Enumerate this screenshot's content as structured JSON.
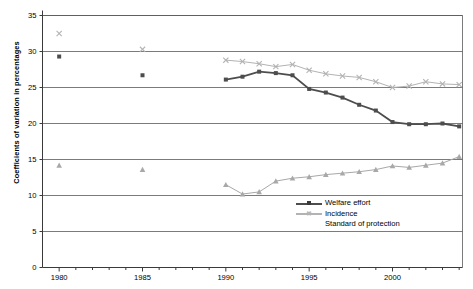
{
  "chart_data": {
    "type": "line",
    "title": "",
    "xlabel": "",
    "ylabel": "Coefficients of variation in percentages",
    "xlim": [
      1979,
      2004.2
    ],
    "ylim": [
      0,
      35
    ],
    "ytick_step": 5,
    "yticks": [
      "0",
      "5",
      "10",
      "15",
      "20",
      "25",
      "30",
      "35"
    ],
    "xticks": [
      "1980",
      "1985",
      "1990",
      "1995",
      "2000"
    ],
    "xtick_values": [
      1980,
      1985,
      1990,
      1995,
      2000
    ],
    "minor_xticks_every": 1,
    "grid": "horizontal",
    "legend_position": "bottom-right",
    "series": [
      {
        "name": "Welfare effort",
        "color": "#4d4d4d",
        "marker": "square",
        "points": [
          {
            "x": 1980,
            "y": 29.3,
            "isolated": true
          },
          {
            "x": 1985,
            "y": 26.7,
            "isolated": true
          },
          {
            "x": 1990,
            "y": 26.1
          },
          {
            "x": 1991,
            "y": 26.5
          },
          {
            "x": 1992,
            "y": 27.2
          },
          {
            "x": 1993,
            "y": 27.0
          },
          {
            "x": 1994,
            "y": 26.7
          },
          {
            "x": 1995,
            "y": 24.8
          },
          {
            "x": 1996,
            "y": 24.3
          },
          {
            "x": 1997,
            "y": 23.6
          },
          {
            "x": 1998,
            "y": 22.6
          },
          {
            "x": 1999,
            "y": 21.8
          },
          {
            "x": 2000,
            "y": 20.2
          },
          {
            "x": 2001,
            "y": 19.9
          },
          {
            "x": 2002,
            "y": 19.9
          },
          {
            "x": 2003,
            "y": 20.0
          },
          {
            "x": 2004,
            "y": 19.6
          }
        ]
      },
      {
        "name": "Incidence",
        "color": "#b3b3b3",
        "marker": "cross",
        "points": [
          {
            "x": 1980,
            "y": 32.5,
            "isolated": true
          },
          {
            "x": 1985,
            "y": 30.3,
            "isolated": true
          },
          {
            "x": 1990,
            "y": 28.8
          },
          {
            "x": 1991,
            "y": 28.6
          },
          {
            "x": 1992,
            "y": 28.3
          },
          {
            "x": 1993,
            "y": 27.9
          },
          {
            "x": 1994,
            "y": 28.2
          },
          {
            "x": 1995,
            "y": 27.4
          },
          {
            "x": 1996,
            "y": 26.9
          },
          {
            "x": 1997,
            "y": 26.6
          },
          {
            "x": 1998,
            "y": 26.4
          },
          {
            "x": 1999,
            "y": 25.8
          },
          {
            "x": 2000,
            "y": 25.0
          },
          {
            "x": 2001,
            "y": 25.2
          },
          {
            "x": 2002,
            "y": 25.8
          },
          {
            "x": 2003,
            "y": 25.5
          },
          {
            "x": 2004,
            "y": 25.4
          }
        ]
      },
      {
        "name": "Standard of protection",
        "color": "#a8a8a8",
        "marker": "triangle",
        "points": [
          {
            "x": 1980,
            "y": 14.2,
            "isolated": true
          },
          {
            "x": 1985,
            "y": 13.6,
            "isolated": true
          },
          {
            "x": 1990,
            "y": 11.5
          },
          {
            "x": 1991,
            "y": 10.2
          },
          {
            "x": 1992,
            "y": 10.5
          },
          {
            "x": 1993,
            "y": 12.0
          },
          {
            "x": 1994,
            "y": 12.4
          },
          {
            "x": 1995,
            "y": 12.6
          },
          {
            "x": 1996,
            "y": 12.9
          },
          {
            "x": 1997,
            "y": 13.1
          },
          {
            "x": 1998,
            "y": 13.3
          },
          {
            "x": 1999,
            "y": 13.6
          },
          {
            "x": 2000,
            "y": 14.1
          },
          {
            "x": 2001,
            "y": 13.9
          },
          {
            "x": 2002,
            "y": 14.2
          },
          {
            "x": 2003,
            "y": 14.5
          },
          {
            "x": 2004,
            "y": 15.4
          }
        ]
      }
    ]
  },
  "legend": {
    "items": [
      {
        "label": "Welfare effort"
      },
      {
        "label": "Incidence"
      },
      {
        "label": "Standard of protection"
      }
    ]
  }
}
